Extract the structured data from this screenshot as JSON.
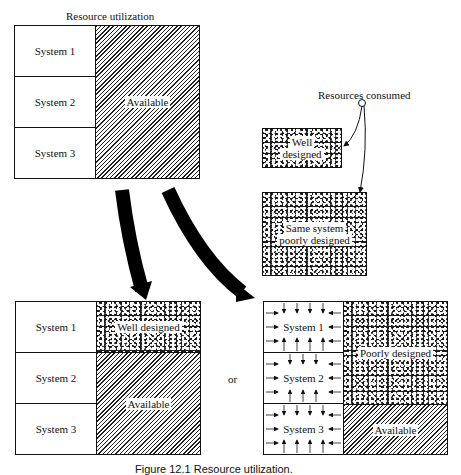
{
  "top_diagram": {
    "title": "Resource utilization",
    "systems": [
      "System 1",
      "System 2",
      "System 3"
    ],
    "available_label": "Available"
  },
  "legend": {
    "resources_consumed": "Resources consumed",
    "well_designed": [
      "Well",
      "designed"
    ],
    "poorly_designed": [
      "Same system",
      "poorly designed"
    ]
  },
  "bottom_left": {
    "systems": [
      "System 1",
      "System 2",
      "System 3"
    ],
    "used_label": "Well designed",
    "available_label": "Available"
  },
  "connector": "or",
  "bottom_right": {
    "systems": [
      "System 1",
      "System 2",
      "System 3"
    ],
    "used_label": "Poorly designed",
    "available_label": "Available"
  },
  "caption": "Figure 12.1 Resource utilization."
}
